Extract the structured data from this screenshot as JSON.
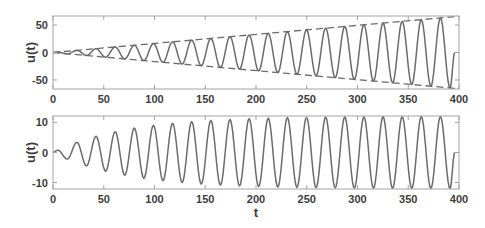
{
  "style": {
    "line_color": "#6b6b6b",
    "axis_color": "#a3a3a3",
    "text_color": "#3c3c3c",
    "background": "#ffffff"
  },
  "chart_data": [
    {
      "panel": "top",
      "type": "line",
      "title": "",
      "xlabel": "",
      "ylabel": "u(t)",
      "xlim": [
        0,
        400
      ],
      "ylim": [
        -66.5,
        66.5
      ],
      "grid": false,
      "legend": null,
      "xticks": [
        0,
        50,
        100,
        150,
        200,
        250,
        300,
        350,
        400
      ],
      "xticklabels": [
        "0",
        "50",
        "100",
        "150",
        "200",
        "250",
        "300",
        "350",
        "400"
      ],
      "yticks": [
        -50,
        0,
        50
      ],
      "yticklabels": [
        "-50",
        "0",
        "50"
      ],
      "series": [
        {
          "id": "response-line",
          "name": "u(t)",
          "style": "solid",
          "interpolation": "smooth",
          "points": [
            [
              0,
              0
            ],
            [
              4.71,
              0.78
            ],
            [
              14.14,
              -2.33
            ],
            [
              23.56,
              3.89
            ],
            [
              32.99,
              -5.44
            ],
            [
              42.41,
              7.0
            ],
            [
              51.84,
              -8.55
            ],
            [
              61.26,
              10.11
            ],
            [
              70.69,
              -11.66
            ],
            [
              80.11,
              13.22
            ],
            [
              89.54,
              -14.78
            ],
            [
              98.96,
              16.33
            ],
            [
              108.38,
              -17.88
            ],
            [
              117.81,
              19.44
            ],
            [
              127.23,
              -21.0
            ],
            [
              136.66,
              22.55
            ],
            [
              146.08,
              -24.1
            ],
            [
              155.51,
              25.66
            ],
            [
              164.93,
              -27.21
            ],
            [
              174.36,
              28.77
            ],
            [
              183.78,
              -30.32
            ],
            [
              193.21,
              31.88
            ],
            [
              202.63,
              -33.43
            ],
            [
              212.06,
              34.99
            ],
            [
              221.48,
              -36.55
            ],
            [
              230.91,
              38.1
            ],
            [
              240.33,
              -39.65
            ],
            [
              249.76,
              41.21
            ],
            [
              259.18,
              -42.77
            ],
            [
              268.61,
              44.32
            ],
            [
              278.03,
              -45.87
            ],
            [
              287.46,
              47.43
            ],
            [
              296.88,
              -48.98
            ],
            [
              306.31,
              50.54
            ],
            [
              315.73,
              -52.1
            ],
            [
              325.16,
              53.66
            ],
            [
              334.58,
              -55.2
            ],
            [
              344.01,
              56.76
            ],
            [
              353.43,
              -58.32
            ],
            [
              362.85,
              59.87
            ],
            [
              372.28,
              -61.42
            ],
            [
              381.7,
              62.98
            ],
            [
              391.13,
              -64.54
            ],
            [
              395.84,
              0
            ]
          ]
        },
        {
          "id": "upper-envelope-line",
          "name": "upper envelope",
          "style": "dashed",
          "interpolation": "linear",
          "points": [
            [
              0,
              0
            ],
            [
              400,
              66
            ]
          ]
        },
        {
          "id": "lower-envelope-line",
          "name": "lower envelope",
          "style": "dashed",
          "interpolation": "linear",
          "points": [
            [
              0,
              0
            ],
            [
              400,
              -66
            ]
          ]
        }
      ]
    },
    {
      "panel": "bottom",
      "type": "line",
      "title": "",
      "xlabel": "t",
      "ylabel": "u(t)",
      "xlim": [
        0,
        400
      ],
      "ylim": [
        -12.1,
        12.1
      ],
      "grid": false,
      "legend": null,
      "xticks": [
        0,
        50,
        100,
        150,
        200,
        250,
        300,
        350,
        400
      ],
      "xticklabels": [
        "0",
        "50",
        "100",
        "150",
        "200",
        "250",
        "300",
        "350",
        "400"
      ],
      "yticks": [
        -10,
        0,
        10
      ],
      "yticklabels": [
        "-10",
        "0",
        "10"
      ],
      "series": [
        {
          "id": "response-line",
          "name": "u(t)",
          "style": "solid",
          "interpolation": "smooth",
          "points": [
            [
              0,
              0
            ],
            [
              4.71,
              0.77
            ],
            [
              14.14,
              -2.16
            ],
            [
              23.56,
              3.37
            ],
            [
              32.99,
              -4.44
            ],
            [
              42.41,
              5.37
            ],
            [
              51.84,
              -6.19
            ],
            [
              61.26,
              6.91
            ],
            [
              70.69,
              -7.54
            ],
            [
              80.11,
              8.09
            ],
            [
              89.54,
              -8.57
            ],
            [
              98.96,
              9.0
            ],
            [
              108.38,
              -9.37
            ],
            [
              117.81,
              9.69
            ],
            [
              127.23,
              -9.98
            ],
            [
              136.66,
              10.23
            ],
            [
              146.08,
              -10.45
            ],
            [
              155.51,
              10.64
            ],
            [
              164.93,
              -10.81
            ],
            [
              174.36,
              10.95
            ],
            [
              183.78,
              -11.08
            ],
            [
              193.21,
              11.2
            ],
            [
              202.63,
              -11.3
            ],
            [
              212.06,
              11.38
            ],
            [
              221.48,
              -11.46
            ],
            [
              230.91,
              11.53
            ],
            [
              240.33,
              -11.58
            ],
            [
              249.76,
              11.64
            ],
            [
              259.18,
              -11.68
            ],
            [
              268.61,
              11.72
            ],
            [
              278.03,
              -11.76
            ],
            [
              287.46,
              11.79
            ],
            [
              296.88,
              -11.81
            ],
            [
              306.31,
              11.84
            ],
            [
              315.73,
              -11.86
            ],
            [
              325.16,
              11.87
            ],
            [
              334.58,
              -11.89
            ],
            [
              344.01,
              11.9
            ],
            [
              353.43,
              -11.91
            ],
            [
              362.85,
              11.93
            ],
            [
              372.28,
              -11.93
            ],
            [
              381.7,
              11.94
            ],
            [
              391.13,
              -11.95
            ],
            [
              395.84,
              0
            ]
          ]
        }
      ]
    }
  ]
}
